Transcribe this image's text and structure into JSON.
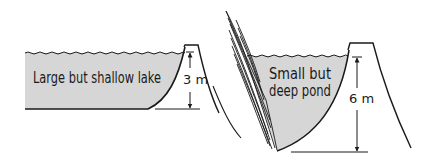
{
  "diagram": {
    "colors": {
      "water": "#d6d6d6",
      "ink": "#1a1a1a",
      "background": "#ffffff"
    },
    "lake": {
      "label": "Large but shallow lake",
      "depth_label": "3 m"
    },
    "pond": {
      "label_line1": "Small but",
      "label_line2": "deep pond",
      "depth_label": "6 m"
    }
  }
}
